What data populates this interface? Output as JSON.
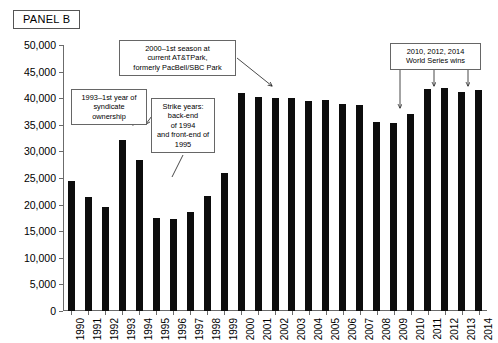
{
  "panel": {
    "label": "PANEL B"
  },
  "chart_data": {
    "type": "bar",
    "title": "PANEL B",
    "xlabel": "",
    "ylabel": "",
    "ylim": [
      0,
      50000
    ],
    "ytick_step": 5000,
    "grid": false,
    "legend": null,
    "bar_color": "#0d0d0d",
    "categories": [
      "1990",
      "1991",
      "1992",
      "1993",
      "1994",
      "1995",
      "1996",
      "1997",
      "1998",
      "1999",
      "2000",
      "2001",
      "2002",
      "2003",
      "2004",
      "2005",
      "2006",
      "2007",
      "2008",
      "2009",
      "2010",
      "2011",
      "2012",
      "2013",
      "2014"
    ],
    "values": [
      24500,
      21500,
      19500,
      32200,
      28400,
      17400,
      17300,
      18600,
      21700,
      25900,
      40900,
      40300,
      40000,
      40100,
      39500,
      39700,
      39000,
      38700,
      35500,
      35400,
      37100,
      41700,
      41900,
      41200,
      41500
    ],
    "yticks": [
      "0",
      "5,000",
      "10,000",
      "15,000",
      "20,000",
      "25,000",
      "30,000",
      "35,000",
      "40,000",
      "45,000",
      "50,000"
    ],
    "annotations": [
      {
        "id": "syndicate",
        "text": "1993–1st year of syndicate ownership",
        "target_category": "1993"
      },
      {
        "id": "strike",
        "text": "Strike years: back-end of 1994 and front-end of 1995",
        "target_category": "1995"
      },
      {
        "id": "ballpark",
        "text": "2000–1st season at current AT&TPark, formerly PacBell/SBC Park",
        "target_category": "2000"
      },
      {
        "id": "world-series",
        "text": "2010, 2012, 2014 World Series wins",
        "target_category": "2010"
      }
    ]
  },
  "callouts": {
    "syndicate": {
      "line1": "1993–1st year of",
      "line2": "syndicate ownership"
    },
    "strike": {
      "line1": "Strike years:",
      "line2": "back-end",
      "line3": "of 1994",
      "line4": "and front-end of",
      "line5": "1995"
    },
    "ballpark": {
      "line1": "2000–1st season at",
      "line2": "current AT&TPark,",
      "line3": "formerly PacBell/SBC Park"
    },
    "worldseries": {
      "line1": "2010, 2012, 2014",
      "line2": "World Series wins"
    }
  }
}
